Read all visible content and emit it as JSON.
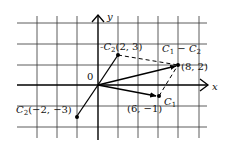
{
  "diagram": {
    "axes": {
      "x_label": "x",
      "y_label": "y",
      "origin_label": "0"
    },
    "grid": {
      "unit_px": 10,
      "line_every_units": 2,
      "origin_px": [
        98,
        85
      ]
    },
    "points": [
      {
        "id": "neg_c2",
        "label_prefix": "-C",
        "label_sub": "2",
        "coords": "(2, 3)",
        "x": 2,
        "y": 3
      },
      {
        "id": "diff",
        "label_prefix": "",
        "label_sub": "",
        "coords": "(8, 2)",
        "x": 8,
        "y": 2
      },
      {
        "id": "c1",
        "label_prefix": "C",
        "label_sub": "1",
        "coords": "(6, −1)",
        "x": 6,
        "y": -1
      },
      {
        "id": "c2",
        "label_prefix": "C",
        "label_sub": "2",
        "coords": "(−2, −3)",
        "x": -2,
        "y": -3
      }
    ],
    "vector_labels": {
      "difference": {
        "a": "C",
        "a_sub": "1",
        "op": " − ",
        "b": "C",
        "b_sub": "2"
      },
      "c1_label": "C",
      "c1_sub": "1"
    },
    "vectors": [
      {
        "from": [
          0,
          0
        ],
        "to": [
          2,
          3
        ],
        "style": "solid",
        "arrow": false
      },
      {
        "from": [
          0,
          0
        ],
        "to": [
          -2,
          -3
        ],
        "style": "solid",
        "arrow": false
      },
      {
        "from": [
          0,
          0
        ],
        "to": [
          8,
          2
        ],
        "style": "solid",
        "arrow": true
      },
      {
        "from": [
          0,
          0
        ],
        "to": [
          6,
          -1
        ],
        "style": "solid",
        "arrow": true
      },
      {
        "from": [
          2,
          3
        ],
        "to": [
          8,
          2
        ],
        "style": "dashed",
        "arrow": false
      },
      {
        "from": [
          6,
          -1
        ],
        "to": [
          8,
          2
        ],
        "style": "dashed",
        "arrow": false
      }
    ]
  }
}
